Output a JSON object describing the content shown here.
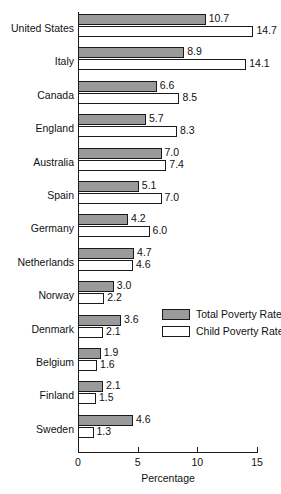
{
  "chart_data": {
    "type": "bar",
    "orientation": "horizontal",
    "title": "",
    "xlabel": "Percentage",
    "ylabel": "",
    "xlim": [
      0,
      15
    ],
    "xticks": [
      0,
      5,
      10,
      15
    ],
    "xtick_labels": [
      "0",
      "5",
      "10",
      "15"
    ],
    "grid": false,
    "legend_position": "center-right",
    "categories": [
      "United States",
      "Italy",
      "Canada",
      "England",
      "Australia",
      "Spain",
      "Germany",
      "Netherlands",
      "Norway",
      "Denmark",
      "Belgium",
      "Finland",
      "Sweden"
    ],
    "series": [
      {
        "name": "Total Poverty Rate",
        "color": "#9a9a9a",
        "values": [
          10.7,
          8.9,
          6.6,
          5.7,
          7.0,
          5.1,
          4.2,
          4.7,
          3.0,
          3.6,
          1.9,
          2.1,
          4.6
        ],
        "labels": [
          "10.7",
          "8.9",
          "6.6",
          "5.7",
          "7.0",
          "5.1",
          "4.2",
          "4.7",
          "3.0",
          "3.6",
          "1.9",
          "2.1",
          "4.6"
        ]
      },
      {
        "name": "Child Poverty Rate",
        "color": "#ffffff",
        "values": [
          14.7,
          14.1,
          8.5,
          8.3,
          7.4,
          7.0,
          6.0,
          4.6,
          2.2,
          2.1,
          1.6,
          1.5,
          1.3
        ],
        "labels": [
          "14.7",
          "14.1",
          "8.5",
          "8.3",
          "7.4",
          "7.0",
          "6.0",
          "4.6",
          "2.2",
          "2.1",
          "1.6",
          "1.5",
          "1.3"
        ]
      }
    ]
  },
  "legend": {
    "items": [
      {
        "label": "Total Poverty Rate",
        "swatch": "total"
      },
      {
        "label": "Child Poverty Rate",
        "swatch": "child"
      }
    ]
  },
  "axis": {
    "x_title": "Percentage"
  }
}
